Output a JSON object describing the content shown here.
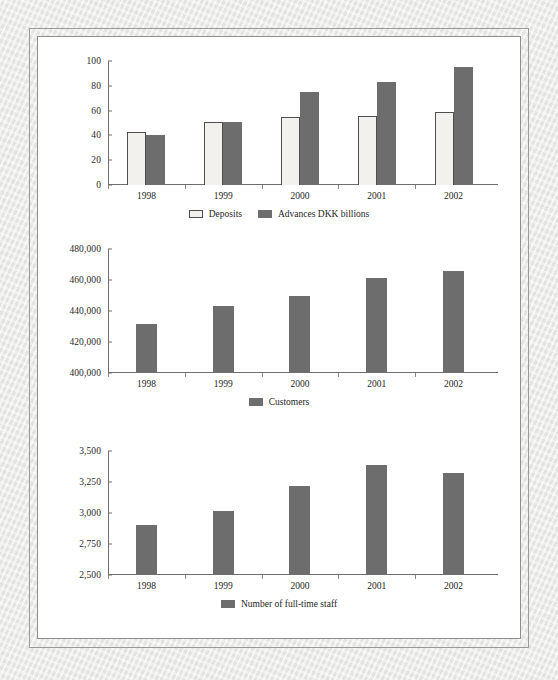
{
  "page": {
    "background_color": "#e9e9e7",
    "page_color": "#ffffff",
    "frame_color": "#9a9a98"
  },
  "palette": {
    "bar_dark": "#6d6d6d",
    "bar_light": "#f3f1ee",
    "bar_outline": "#4e4e4e",
    "axis": "#6e6e6e",
    "text": "#1e1e1e"
  },
  "chart_data": [
    {
      "id": "deposits-advances",
      "type": "bar",
      "title": "",
      "xlabel": "",
      "ylabel": "",
      "categories": [
        "1998",
        "1999",
        "2000",
        "2001",
        "2002"
      ],
      "yticks": [
        "0",
        "20",
        "40",
        "60",
        "80",
        "100"
      ],
      "ytick_values": [
        0,
        20,
        40,
        60,
        80,
        100
      ],
      "ylim": [
        0,
        100
      ],
      "grid": false,
      "legend_position": "bottom",
      "series": [
        {
          "name": "Deposits",
          "color": "#f3f1ee",
          "style": "outlined",
          "values": [
            43,
            50.5,
            55,
            55.5,
            59
          ]
        },
        {
          "name": "Advances DKK billions",
          "color": "#6d6d6d",
          "style": "filled",
          "values": [
            40,
            50.5,
            75,
            83,
            95
          ]
        }
      ]
    },
    {
      "id": "customers",
      "type": "bar",
      "title": "",
      "xlabel": "",
      "ylabel": "",
      "categories": [
        "1998",
        "1999",
        "2000",
        "2001",
        "2002"
      ],
      "yticks": [
        "400,000",
        "420,000",
        "440,000",
        "460,000",
        "480,000"
      ],
      "ytick_values": [
        400000,
        420000,
        440000,
        460000,
        480000
      ],
      "ylim": [
        400000,
        480000
      ],
      "grid": false,
      "legend_position": "bottom",
      "series": [
        {
          "name": "Customers",
          "color": "#6d6d6d",
          "style": "filled",
          "values": [
            431500,
            443000,
            450000,
            461500,
            465500
          ]
        }
      ]
    },
    {
      "id": "full-time-staff",
      "type": "bar",
      "title": "",
      "xlabel": "",
      "ylabel": "",
      "categories": [
        "1998",
        "1999",
        "2000",
        "2001",
        "2002"
      ],
      "yticks": [
        "2,500",
        "2,750",
        "3,000",
        "3,250",
        "3,500"
      ],
      "ytick_values": [
        2500,
        2750,
        3000,
        3250,
        3500
      ],
      "ylim": [
        2500,
        3500
      ],
      "grid": false,
      "legend_position": "bottom",
      "series": [
        {
          "name": "Number of full-time staff",
          "color": "#6d6d6d",
          "style": "filled",
          "values": [
            2900,
            3020,
            3215,
            3390,
            3320
          ]
        }
      ]
    }
  ]
}
